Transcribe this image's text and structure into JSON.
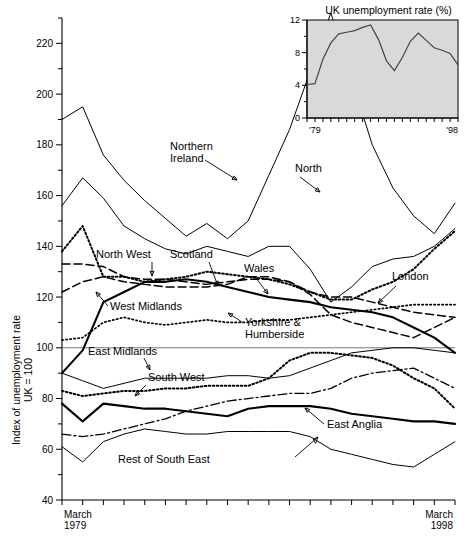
{
  "figure": {
    "ylabel_line1": "Index of unemployment rate",
    "ylabel_line2": "UK = 100",
    "x_start_line1": "March",
    "x_start_line2": "1979",
    "x_end_line1": "March",
    "x_end_line2": "1998",
    "reference_value": 100
  },
  "inset": {
    "title": "UK unemployment rate (%)",
    "x_start": "'79",
    "x_end": "'98",
    "yticks": [
      0,
      4,
      8,
      12
    ],
    "background": "#d9d9d9"
  },
  "labels": {
    "northern_ireland": "Northern\nIreland",
    "north": "North",
    "north_west": "North West",
    "scotland": "Scotland",
    "wales": "Wales",
    "london": "London",
    "west_midlands": "West Midlands",
    "yorkshire": "Yorkshire &\nHumberside",
    "east_midlands": "East Midlands",
    "south_west": "South West",
    "east_anglia": "East Anglia",
    "rest_of_south_east": "Rest of South East"
  },
  "chart_data": {
    "type": "line",
    "title": "",
    "xlabel": "",
    "ylabel": "Index of unemployment rate, UK = 100",
    "xlim": [
      1979,
      1998
    ],
    "ylim": [
      40,
      230
    ],
    "yticks": [
      40,
      60,
      80,
      100,
      120,
      140,
      160,
      180,
      200,
      220
    ],
    "grid": false,
    "legend": "inline-annotations",
    "x": [
      1979,
      1980,
      1981,
      1982,
      1983,
      1984,
      1985,
      1986,
      1987,
      1988,
      1989,
      1990,
      1991,
      1992,
      1993,
      1994,
      1995,
      1996,
      1997,
      1998
    ],
    "series": [
      {
        "name": "Northern Ireland",
        "style": "solid-thin",
        "values": [
          190,
          195,
          176,
          166,
          158,
          151,
          144,
          149,
          143,
          150,
          168,
          186,
          209,
          232,
          206,
          180,
          163,
          152,
          145,
          157
        ]
      },
      {
        "name": "North",
        "style": "solid-thin",
        "values": [
          156,
          167,
          159,
          148,
          143,
          139,
          137,
          140,
          138,
          136,
          140,
          140,
          131,
          118,
          124,
          132,
          135,
          136,
          140,
          147
        ]
      },
      {
        "name": "Scotland",
        "style": "dotted-heavy",
        "values": [
          138,
          148,
          128,
          128,
          126,
          127,
          128,
          130,
          129,
          128,
          127,
          125,
          122,
          119,
          119,
          123,
          126,
          131,
          139,
          146
        ]
      },
      {
        "name": "North West",
        "style": "dashed",
        "values": [
          133,
          133,
          132,
          128,
          127,
          127,
          126,
          125,
          126,
          127,
          127,
          126,
          122,
          120,
          120,
          118,
          116,
          114,
          113,
          112
        ]
      },
      {
        "name": "Wales",
        "style": "dashed",
        "values": [
          122,
          126,
          128,
          126,
          125,
          124,
          124,
          124,
          125,
          128,
          128,
          126,
          121,
          113,
          110,
          108,
          106,
          104,
          108,
          112
        ]
      },
      {
        "name": "West Midlands",
        "style": "solid-thick",
        "values": [
          90,
          99,
          118,
          122,
          126,
          126,
          127,
          126,
          124,
          122,
          120,
          119,
          118,
          116,
          115,
          114,
          112,
          108,
          104,
          98
        ]
      },
      {
        "name": "Yorkshire & Humberside",
        "style": "dotted-fine",
        "values": [
          103,
          104,
          110,
          112,
          110,
          109,
          110,
          111,
          110,
          110,
          111,
          111,
          112,
          113,
          114,
          115,
          116,
          117,
          117,
          117
        ]
      },
      {
        "name": "London",
        "style": "dash-dot",
        "values": [
          66,
          65,
          66,
          68,
          70,
          72,
          75,
          77,
          79,
          80,
          81,
          82,
          82,
          84,
          88,
          90,
          91,
          92,
          88,
          84
        ]
      },
      {
        "name": "East Midlands",
        "style": "solid-thin",
        "values": [
          90,
          87,
          84,
          86,
          88,
          88,
          88,
          88,
          89,
          89,
          88,
          89,
          92,
          95,
          98,
          99,
          100,
          100,
          99,
          98
        ]
      },
      {
        "name": "South West",
        "style": "dotted-heavy",
        "values": [
          83,
          81,
          82,
          83,
          83,
          84,
          84,
          85,
          85,
          85,
          88,
          95,
          98,
          98,
          97,
          96,
          93,
          88,
          84,
          76
        ]
      },
      {
        "name": "East Anglia",
        "style": "solid-thick",
        "values": [
          78,
          71,
          78,
          77,
          76,
          76,
          75,
          74,
          73,
          76,
          77,
          77,
          77,
          76,
          74,
          73,
          72,
          71,
          71,
          70
        ]
      },
      {
        "name": "Rest of South East",
        "style": "solid-thin",
        "values": [
          61,
          55,
          63,
          66,
          68,
          67,
          66,
          66,
          67,
          67,
          67,
          67,
          65,
          60,
          58,
          56,
          54,
          53,
          58,
          63
        ]
      }
    ]
  },
  "inset_chart_data": {
    "type": "line",
    "title": "UK unemployment rate (%)",
    "xlabel": "",
    "ylabel": "%",
    "xlim": [
      1979,
      1998
    ],
    "ylim": [
      0,
      12
    ],
    "yticks": [
      0,
      4,
      8,
      12
    ],
    "x": [
      1979,
      1980,
      1981,
      1982,
      1983,
      1984,
      1985,
      1986,
      1987,
      1988,
      1989,
      1990,
      1991,
      1992,
      1993,
      1994,
      1995,
      1996,
      1997,
      1998
    ],
    "values": [
      4.1,
      4.2,
      7.2,
      9.2,
      10.3,
      10.5,
      10.7,
      11.1,
      11.4,
      9.6,
      7.0,
      5.8,
      7.4,
      9.4,
      10.4,
      9.5,
      8.6,
      8.3,
      7.9,
      6.5
    ]
  }
}
